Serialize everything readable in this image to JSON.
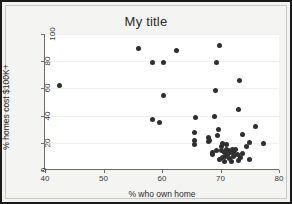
{
  "window": {
    "background_color": "#f4f4f2",
    "border_color": "#1a1a1a"
  },
  "chart_data": {
    "type": "scatter",
    "title": "My title",
    "xlabel": "% who own home",
    "ylabel": "% homes cost $100K+",
    "xlim": [
      40,
      80
    ],
    "ylim": [
      0,
      100
    ],
    "xticks": [
      40,
      50,
      60,
      70,
      80
    ],
    "yticks": [
      0,
      20,
      40,
      60,
      80,
      100
    ],
    "grid": false,
    "legend": false,
    "marker_color": "#2f2f2f",
    "marker_size": 5,
    "n_points": 55,
    "points": [
      [
        42.5,
        62.0
      ],
      [
        56.0,
        89.0
      ],
      [
        58.4,
        79.0
      ],
      [
        60.2,
        79.4
      ],
      [
        62.4,
        87.6
      ],
      [
        69.9,
        91.6
      ],
      [
        69.3,
        79.4
      ],
      [
        73.3,
        65.6
      ],
      [
        69.2,
        58.2
      ],
      [
        60.2,
        54.6
      ],
      [
        73.0,
        44.8
      ],
      [
        65.7,
        38.8
      ],
      [
        69.0,
        39.6
      ],
      [
        58.4,
        37.2
      ],
      [
        59.5,
        35.0
      ],
      [
        76.0,
        31.8
      ],
      [
        69.6,
        30.0
      ],
      [
        65.5,
        27.4
      ],
      [
        73.8,
        25.8
      ],
      [
        68.0,
        24.2
      ],
      [
        69.5,
        25.4
      ],
      [
        68.1,
        22.0
      ],
      [
        65.6,
        21.4
      ],
      [
        65.6,
        19.0
      ],
      [
        68.0,
        21.0
      ],
      [
        70.4,
        19.8
      ],
      [
        70.2,
        17.6
      ],
      [
        71.0,
        19.0
      ],
      [
        74.5,
        17.2
      ],
      [
        77.3,
        19.4
      ],
      [
        75.0,
        20.2
      ],
      [
        68.7,
        12.8
      ],
      [
        68.6,
        11.2
      ],
      [
        69.4,
        14.6
      ],
      [
        70.1,
        14.0
      ],
      [
        70.6,
        13.2
      ],
      [
        71.0,
        15.4
      ],
      [
        71.4,
        14.2
      ],
      [
        71.7,
        12.6
      ],
      [
        72.0,
        14.8
      ],
      [
        72.3,
        13.0
      ],
      [
        72.6,
        15.0
      ],
      [
        71.2,
        11.4
      ],
      [
        70.8,
        10.2
      ],
      [
        70.3,
        9.0
      ],
      [
        69.9,
        7.4
      ],
      [
        70.6,
        6.2
      ],
      [
        71.5,
        8.6
      ],
      [
        72.2,
        10.0
      ],
      [
        72.9,
        11.6
      ],
      [
        73.4,
        9.4
      ],
      [
        73.8,
        12.0
      ],
      [
        73.0,
        7.0
      ],
      [
        74.9,
        7.6
      ],
      [
        71.9,
        6.0
      ]
    ]
  }
}
